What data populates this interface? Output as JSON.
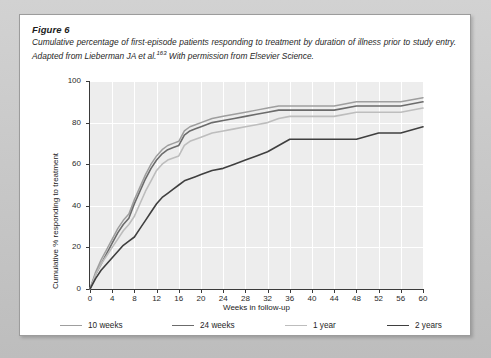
{
  "figure": {
    "label": "Figure 6",
    "description_part1": "Cumulative percentage of first-episode patients responding to treatment by duration of illness prior to study entry. Adapted from Lieberman JA et al.",
    "reference_superscript": "163",
    "description_part2": " With permission from Elsevier Science."
  },
  "colors": {
    "page_background": "#c9c9c9",
    "card_background": "#ffffff",
    "plot_background": "#ededed",
    "gridline": "#ffffff",
    "axis": "#3a3a3a",
    "series_10_weeks": "#9e9e9e",
    "series_24_weeks": "#6b6b6b",
    "series_1_year": "#bdbdbd",
    "series_2_years": "#3f3f3f"
  },
  "chart_data": {
    "type": "line",
    "title": "",
    "xlabel": "Weeks in follow-up",
    "ylabel": "Cumulative % responding to treatment",
    "xlim": [
      0,
      60
    ],
    "ylim": [
      0,
      100
    ],
    "xticks": [
      0,
      4,
      8,
      12,
      16,
      20,
      24,
      28,
      32,
      36,
      40,
      44,
      48,
      52,
      56,
      60
    ],
    "yticks": [
      0,
      20,
      40,
      60,
      80,
      100
    ],
    "grid": true,
    "legend_position": "bottom",
    "x": [
      0,
      1,
      2,
      3,
      4,
      5,
      6,
      7,
      8,
      9,
      10,
      11,
      12,
      13,
      14,
      15,
      16,
      17,
      18,
      19,
      20,
      22,
      24,
      26,
      28,
      30,
      32,
      34,
      36,
      40,
      44,
      48,
      52,
      56,
      60
    ],
    "series": [
      {
        "name": "10 weeks",
        "color": "#9e9e9e",
        "width": 1.5,
        "values": [
          0,
          8,
          14,
          19,
          24,
          29,
          33,
          36,
          43,
          49,
          55,
          60,
          64,
          67,
          69,
          70,
          71,
          76,
          78,
          79,
          80,
          82,
          83,
          84,
          85,
          86,
          87,
          88,
          88,
          88,
          88,
          90,
          90,
          90,
          92
        ]
      },
      {
        "name": "24 weeks",
        "color": "#6b6b6b",
        "width": 1.6,
        "values": [
          0,
          7,
          12,
          17,
          22,
          27,
          31,
          34,
          41,
          47,
          53,
          58,
          62,
          65,
          67,
          68,
          69,
          74,
          76,
          77,
          78,
          80,
          81,
          82,
          83,
          84,
          85,
          86,
          86,
          86,
          86,
          88,
          88,
          88,
          90
        ]
      },
      {
        "name": "1 year",
        "color": "#bdbdbd",
        "width": 1.6,
        "values": [
          0,
          7,
          12,
          16,
          20,
          24,
          28,
          31,
          35,
          41,
          47,
          52,
          57,
          60,
          62,
          63,
          64,
          69,
          71,
          72,
          73,
          75,
          76,
          77,
          78,
          79,
          80,
          82,
          83,
          83,
          83,
          85,
          85,
          85,
          87
        ]
      },
      {
        "name": "2 years",
        "color": "#3f3f3f",
        "width": 1.6,
        "values": [
          0,
          5,
          9,
          12,
          15,
          18,
          21,
          23,
          25,
          29,
          33,
          37,
          41,
          44,
          46,
          48,
          50,
          52,
          53,
          54,
          55,
          57,
          58,
          60,
          62,
          64,
          66,
          69,
          72,
          72,
          72,
          72,
          75,
          75,
          78
        ]
      }
    ]
  },
  "legend": [
    {
      "label": "10 weeks",
      "color": "#9e9e9e",
      "width": 1.5
    },
    {
      "label": "24 weeks",
      "color": "#6b6b6b",
      "width": 1.8
    },
    {
      "label": "1 year",
      "color": "#bdbdbd",
      "width": 1.6
    },
    {
      "label": "2 years",
      "color": "#3f3f3f",
      "width": 1.8
    }
  ]
}
